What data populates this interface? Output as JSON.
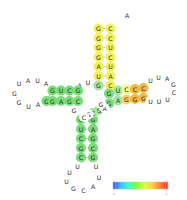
{
  "figure": {
    "background_color": "#ffffff",
    "text_color": "#2b2b2b",
    "backbone_color": "#7a7a7a"
  },
  "palette": {
    "green": "#77dd77",
    "green_light": "#9fe6a0",
    "yellow": "#f2f25c",
    "yellow_pale": "#f6f68a",
    "orange": "#f5b942",
    "orange_light": "#f8cf6b",
    "uncolored": "#ffffff"
  },
  "colorbar": {
    "name": "probability-colorbar",
    "min_label": "0",
    "max_label": "1",
    "stops": [
      "#4040ff",
      "#40c0ff",
      "#40ffc0",
      "#80ff40",
      "#e0ff40",
      "#ffd040",
      "#ff8040",
      "#ff3030"
    ]
  },
  "nucleotides": [
    {
      "id": "n001",
      "base": "A",
      "x": 127.0,
      "y": 15.0,
      "fill": "#ffffff",
      "region": "top-hairpin-loop"
    },
    {
      "id": "n002",
      "base": "C",
      "x": 110.5,
      "y": 28.5,
      "fill": "#f2f25c",
      "region": "top-stem-right"
    },
    {
      "id": "n003",
      "base": "C",
      "x": 110.5,
      "y": 38.0,
      "fill": "#f2f25c",
      "region": "top-stem-right"
    },
    {
      "id": "n004",
      "base": "U",
      "x": 110.5,
      "y": 47.5,
      "fill": "#f2f25c",
      "region": "top-stem-right"
    },
    {
      "id": "n005",
      "base": "C",
      "x": 110.5,
      "y": 57.0,
      "fill": "#f2f25c",
      "region": "top-stem-right"
    },
    {
      "id": "n006",
      "base": "U",
      "x": 110.5,
      "y": 66.5,
      "fill": "#f2f25c",
      "region": "top-stem-right"
    },
    {
      "id": "n007",
      "base": "A",
      "x": 110.5,
      "y": 76.0,
      "fill": "#f2f25c",
      "region": "top-stem-right"
    },
    {
      "id": "n008",
      "base": "C",
      "x": 110.5,
      "y": 85.5,
      "fill": "#f2f25c",
      "region": "top-stem-right"
    },
    {
      "id": "n009",
      "base": "G",
      "x": 98.5,
      "y": 28.5,
      "fill": "#f2f25c",
      "region": "top-stem-left"
    },
    {
      "id": "n010",
      "base": "G",
      "x": 98.5,
      "y": 38.0,
      "fill": "#f2f25c",
      "region": "top-stem-left"
    },
    {
      "id": "n011",
      "base": "G",
      "x": 98.5,
      "y": 47.5,
      "fill": "#f2f25c",
      "region": "top-stem-left"
    },
    {
      "id": "n012",
      "base": "G",
      "x": 98.5,
      "y": 57.0,
      "fill": "#f2f25c",
      "region": "top-stem-left"
    },
    {
      "id": "n013",
      "base": "A",
      "x": 98.5,
      "y": 66.5,
      "fill": "#f2f25c",
      "region": "top-stem-left"
    },
    {
      "id": "n014",
      "base": "U",
      "x": 98.5,
      "y": 76.0,
      "fill": "#f2f25c",
      "region": "top-stem-left"
    },
    {
      "id": "n015",
      "base": "G",
      "x": 98.5,
      "y": 85.5,
      "fill": "#9fe6a0",
      "region": "top-stem-left"
    },
    {
      "id": "n016",
      "base": "U",
      "x": 88.0,
      "y": 82.5,
      "fill": "#ffffff",
      "region": "central-junction"
    },
    {
      "id": "n017",
      "base": "A",
      "x": 79.5,
      "y": 85.5,
      "fill": "#ffffff",
      "region": "central-junction"
    },
    {
      "id": "n018",
      "base": "U",
      "x": 19.0,
      "y": 83.5,
      "fill": "#ffffff",
      "region": "left-hairpin-loop"
    },
    {
      "id": "n019",
      "base": "A",
      "x": 28.0,
      "y": 80.0,
      "fill": "#ffffff",
      "region": "left-hairpin-loop"
    },
    {
      "id": "n020",
      "base": "U",
      "x": 37.5,
      "y": 80.0,
      "fill": "#ffffff",
      "region": "left-hairpin-loop"
    },
    {
      "id": "n021",
      "base": "A",
      "x": 46.0,
      "y": 83.5,
      "fill": "#ffffff",
      "region": "left-hairpin-loop"
    },
    {
      "id": "n022",
      "base": "G",
      "x": 14.5,
      "y": 93.0,
      "fill": "#ffffff",
      "region": "left-hairpin-loop"
    },
    {
      "id": "n023",
      "base": "G",
      "x": 19.0,
      "y": 102.5,
      "fill": "#ffffff",
      "region": "left-hairpin-loop"
    },
    {
      "id": "n024",
      "base": "U",
      "x": 28.5,
      "y": 106.0,
      "fill": "#ffffff",
      "region": "left-hairpin-loop"
    },
    {
      "id": "n025",
      "base": "A",
      "x": 38.0,
      "y": 104.5,
      "fill": "#ffffff",
      "region": "left-hairpin-loop"
    },
    {
      "id": "n026",
      "base": "G",
      "x": 46.5,
      "y": 101.0,
      "fill": "#77dd77",
      "region": "left-stem-bottom"
    },
    {
      "id": "n027",
      "base": "G",
      "x": 52.5,
      "y": 90.5,
      "fill": "#77dd77",
      "region": "left-stem-top"
    },
    {
      "id": "n028",
      "base": "U",
      "x": 61.0,
      "y": 90.5,
      "fill": "#77dd77",
      "region": "left-stem-top"
    },
    {
      "id": "n029",
      "base": "C",
      "x": 69.5,
      "y": 90.5,
      "fill": "#77dd77",
      "region": "left-stem-top"
    },
    {
      "id": "n030",
      "base": "G",
      "x": 78.0,
      "y": 90.5,
      "fill": "#77dd77",
      "region": "left-stem-top"
    },
    {
      "id": "n031",
      "base": "G",
      "x": 52.5,
      "y": 101.0,
      "fill": "#77dd77",
      "region": "left-stem-bottom"
    },
    {
      "id": "n032",
      "base": "A",
      "x": 61.0,
      "y": 101.0,
      "fill": "#77dd77",
      "region": "left-stem-bottom"
    },
    {
      "id": "n033",
      "base": "G",
      "x": 69.5,
      "y": 101.0,
      "fill": "#77dd77",
      "region": "left-stem-bottom"
    },
    {
      "id": "n034",
      "base": "C",
      "x": 78.0,
      "y": 101.0,
      "fill": "#77dd77",
      "region": "left-stem-bottom"
    },
    {
      "id": "n035",
      "base": "G",
      "x": 74.0,
      "y": 110.5,
      "fill": "#ffffff",
      "region": "central-junction"
    },
    {
      "id": "n036",
      "base": "G",
      "x": 109.0,
      "y": 93.5,
      "fill": "#77dd77",
      "region": "right-stem-top"
    },
    {
      "id": "n037",
      "base": "U",
      "x": 118.0,
      "y": 90.5,
      "fill": "#9fe6a0",
      "region": "right-stem-top"
    },
    {
      "id": "n038",
      "base": "C",
      "x": 126.5,
      "y": 89.5,
      "fill": "#f6f68a",
      "region": "right-stem-top"
    },
    {
      "id": "n039",
      "base": "C",
      "x": 135.0,
      "y": 89.0,
      "fill": "#f5b942",
      "region": "right-stem-top"
    },
    {
      "id": "n040",
      "base": "C",
      "x": 143.5,
      "y": 88.0,
      "fill": "#f5b942",
      "region": "right-stem-top"
    },
    {
      "id": "n041",
      "base": "G",
      "x": 109.0,
      "y": 103.5,
      "fill": "#77dd77",
      "region": "right-stem-bottom"
    },
    {
      "id": "n042",
      "base": "A",
      "x": 118.0,
      "y": 100.5,
      "fill": "#9fe6a0",
      "region": "right-stem-bottom"
    },
    {
      "id": "n043",
      "base": "G",
      "x": 126.5,
      "y": 99.5,
      "fill": "#f8cf6b",
      "region": "right-stem-bottom"
    },
    {
      "id": "n044",
      "base": "G",
      "x": 135.0,
      "y": 99.0,
      "fill": "#f5b942",
      "region": "right-stem-bottom"
    },
    {
      "id": "n045",
      "base": "G",
      "x": 143.5,
      "y": 98.0,
      "fill": "#f5b942",
      "region": "right-stem-bottom"
    },
    {
      "id": "n046",
      "base": "U",
      "x": 150.5,
      "y": 80.5,
      "fill": "#ffffff",
      "region": "right-hairpin-loop"
    },
    {
      "id": "n047",
      "base": "U",
      "x": 158.5,
      "y": 77.5,
      "fill": "#ffffff",
      "region": "right-hairpin-loop"
    },
    {
      "id": "n048",
      "base": "A",
      "x": 167.0,
      "y": 78.0,
      "fill": "#ffffff",
      "region": "right-hairpin-loop"
    },
    {
      "id": "n049",
      "base": "G",
      "x": 173.5,
      "y": 84.0,
      "fill": "#ffffff",
      "region": "right-hairpin-loop"
    },
    {
      "id": "n050",
      "base": "C",
      "x": 174.0,
      "y": 92.5,
      "fill": "#ffffff",
      "region": "right-hairpin-loop"
    },
    {
      "id": "n051",
      "base": "U",
      "x": 167.5,
      "y": 99.0,
      "fill": "#ffffff",
      "region": "right-hairpin-loop"
    },
    {
      "id": "n052",
      "base": "U",
      "x": 159.0,
      "y": 101.0,
      "fill": "#ffffff",
      "region": "right-hairpin-loop"
    },
    {
      "id": "n053",
      "base": "U",
      "x": 150.5,
      "y": 101.0,
      "fill": "#ffffff",
      "region": "right-hairpin-loop"
    },
    {
      "id": "n054",
      "base": "C",
      "x": 81.0,
      "y": 119.5,
      "fill": "#77dd77",
      "region": "bottom-stem-left"
    },
    {
      "id": "n055",
      "base": "U",
      "x": 81.0,
      "y": 129.0,
      "fill": "#77dd77",
      "region": "bottom-stem-left"
    },
    {
      "id": "n056",
      "base": "C",
      "x": 81.0,
      "y": 138.5,
      "fill": "#77dd77",
      "region": "bottom-stem-left"
    },
    {
      "id": "n057",
      "base": "G",
      "x": 81.0,
      "y": 148.0,
      "fill": "#77dd77",
      "region": "bottom-stem-left"
    },
    {
      "id": "n058",
      "base": "C",
      "x": 81.0,
      "y": 157.5,
      "fill": "#77dd77",
      "region": "bottom-stem-left"
    },
    {
      "id": "n059",
      "base": "U",
      "x": 77.5,
      "y": 166.5,
      "fill": "#ffffff",
      "region": "bottom-hairpin-loop"
    },
    {
      "id": "n060",
      "base": "G",
      "x": 93.0,
      "y": 119.5,
      "fill": "#77dd77",
      "region": "bottom-stem-right"
    },
    {
      "id": "n061",
      "base": "A",
      "x": 93.0,
      "y": 129.0,
      "fill": "#77dd77",
      "region": "bottom-stem-right"
    },
    {
      "id": "n062",
      "base": "G",
      "x": 93.0,
      "y": 138.5,
      "fill": "#77dd77",
      "region": "bottom-stem-right"
    },
    {
      "id": "n063",
      "base": "C",
      "x": 93.0,
      "y": 148.0,
      "fill": "#77dd77",
      "region": "bottom-stem-right"
    },
    {
      "id": "n064",
      "base": "G",
      "x": 93.0,
      "y": 157.5,
      "fill": "#77dd77",
      "region": "bottom-stem-right"
    },
    {
      "id": "n065",
      "base": "U",
      "x": 96.0,
      "y": 166.5,
      "fill": "#ffffff",
      "region": "bottom-hairpin-loop"
    },
    {
      "id": "n066",
      "base": "U",
      "x": 69.5,
      "y": 172.0,
      "fill": "#ffffff",
      "region": "bottom-hairpin-loop"
    },
    {
      "id": "n067",
      "base": "U",
      "x": 66.5,
      "y": 181.0,
      "fill": "#ffffff",
      "region": "bottom-hairpin-loop"
    },
    {
      "id": "n068",
      "base": "G",
      "x": 73.5,
      "y": 188.0,
      "fill": "#ffffff",
      "region": "bottom-hairpin-loop"
    },
    {
      "id": "n069",
      "base": "C",
      "x": 83.5,
      "y": 190.0,
      "fill": "#ffffff",
      "region": "bottom-hairpin-loop"
    },
    {
      "id": "n070",
      "base": "A",
      "x": 93.0,
      "y": 186.0,
      "fill": "#ffffff",
      "region": "bottom-hairpin-loop"
    },
    {
      "id": "n071",
      "base": "U",
      "x": 99.0,
      "y": 177.5,
      "fill": "#ffffff",
      "region": "bottom-hairpin-loop"
    },
    {
      "id": "n072",
      "base": "G",
      "x": 99.0,
      "y": 110.0,
      "fill": "#9fe6a0",
      "region": "central-junction"
    },
    {
      "id": "n073",
      "base": "C",
      "x": 93.0,
      "y": 113.0,
      "fill": "#9fe6a0",
      "region": "central-junction"
    },
    {
      "id": "n074",
      "base": "G",
      "x": 88.5,
      "y": 114.5,
      "fill": "#ffffff",
      "region": "tail-strand"
    },
    {
      "id": "n075",
      "base": "C",
      "x": 84.0,
      "y": 117.0,
      "fill": "#ffffff",
      "region": "tail-strand"
    },
    {
      "id": "n076",
      "base": "A",
      "x": 104.5,
      "y": 108.0,
      "fill": "#ffffff",
      "region": "tail-strand"
    },
    {
      "id": "n077",
      "base": "G",
      "x": 101.0,
      "y": 104.0,
      "fill": "#ffffff",
      "region": "tail-strand"
    }
  ],
  "base_pairs": [
    {
      "a": "n002",
      "b": "n009"
    },
    {
      "a": "n003",
      "b": "n010"
    },
    {
      "a": "n004",
      "b": "n011"
    },
    {
      "a": "n005",
      "b": "n012"
    },
    {
      "a": "n006",
      "b": "n013"
    },
    {
      "a": "n007",
      "b": "n014"
    },
    {
      "a": "n008",
      "b": "n015"
    },
    {
      "a": "n027",
      "b": "n031"
    },
    {
      "a": "n028",
      "b": "n032"
    },
    {
      "a": "n029",
      "b": "n033"
    },
    {
      "a": "n030",
      "b": "n034"
    },
    {
      "a": "n036",
      "b": "n041"
    },
    {
      "a": "n037",
      "b": "n042"
    },
    {
      "a": "n038",
      "b": "n043"
    },
    {
      "a": "n039",
      "b": "n044"
    },
    {
      "a": "n040",
      "b": "n045"
    },
    {
      "a": "n054",
      "b": "n060"
    },
    {
      "a": "n055",
      "b": "n061"
    },
    {
      "a": "n056",
      "b": "n062"
    },
    {
      "a": "n057",
      "b": "n063"
    },
    {
      "a": "n058",
      "b": "n064"
    }
  ]
}
